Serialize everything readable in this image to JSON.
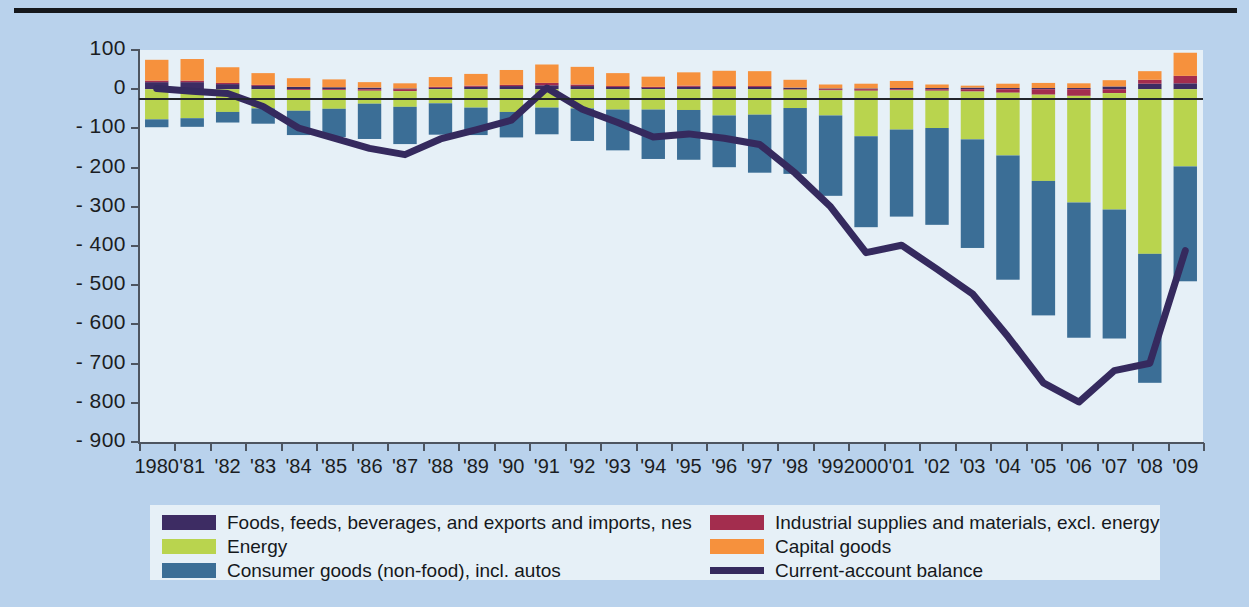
{
  "colors": {
    "background": "#b9d2ec",
    "plot_background": "#e6f0f7",
    "foods": "#3d2c63",
    "industrial": "#a32d4e",
    "energy": "#b9d44e",
    "capital": "#f6913d",
    "consumer": "#3b6e96",
    "balance_line": "#352a5e",
    "axis": "#4d5560",
    "text": "#15181c"
  },
  "axes": {
    "y_ticks": [
      "100",
      "0",
      "- 100",
      "- 200",
      "- 300",
      "- 400",
      "- 500",
      "- 600",
      "- 700",
      "- 800",
      "- 900"
    ],
    "y_tick_values": [
      100,
      0,
      -100,
      -200,
      -300,
      -400,
      -500,
      -600,
      -700,
      -800,
      -900
    ],
    "y_min": -900,
    "y_max": 100,
    "x_labels": [
      "1980",
      "'81",
      "'82",
      "'83",
      "'84",
      "'85",
      "'86",
      "'87",
      "'88",
      "'89",
      "'90",
      "'91",
      "'92",
      "'93",
      "'94",
      "'95",
      "'96",
      "'97",
      "'98",
      "'99",
      "2000",
      "'01",
      "'02",
      "'03",
      "'04",
      "'05",
      "'06",
      "'07",
      "'08",
      "'09"
    ]
  },
  "legend": {
    "left": [
      {
        "label": "Foods, feeds, beverages, and exports and imports, nes",
        "color": "#3d2c63",
        "type": "swatch",
        "icon": "legend-swatch-foods"
      },
      {
        "label": "Energy",
        "color": "#b9d44e",
        "type": "swatch",
        "icon": "legend-swatch-energy"
      },
      {
        "label": "Consumer goods (non-food), incl. autos",
        "color": "#3b6e96",
        "type": "swatch",
        "icon": "legend-swatch-consumer"
      }
    ],
    "right": [
      {
        "label": "Industrial supplies and materials, excl. energy",
        "color": "#a32d4e",
        "type": "swatch",
        "icon": "legend-swatch-industrial"
      },
      {
        "label": "Capital goods",
        "color": "#f6913d",
        "type": "swatch",
        "icon": "legend-swatch-capital"
      },
      {
        "label": "Current-account balance",
        "color": "#352a5e",
        "type": "line",
        "icon": "legend-line-balance"
      }
    ]
  },
  "chart_data": {
    "type": "bar",
    "title": "",
    "subtitle": "",
    "xlabel": "",
    "ylabel": "",
    "ylim": [
      -900,
      100
    ],
    "grid": false,
    "stacked": true,
    "legend_position": "bottom",
    "categories": [
      "1980",
      "1981",
      "1982",
      "1983",
      "1984",
      "1985",
      "1986",
      "1987",
      "1988",
      "1989",
      "1990",
      "1991",
      "1992",
      "1993",
      "1994",
      "1995",
      "1996",
      "1997",
      "1998",
      "1999",
      "2000",
      "2001",
      "2002",
      "2003",
      "2004",
      "2005",
      "2006",
      "2007",
      "2008",
      "2009"
    ],
    "series": [
      {
        "name": "Foods, feeds, beverages, and exports and imports, nes",
        "color": "#3d2c63",
        "values": [
          18,
          18,
          13,
          9,
          6,
          5,
          4,
          2,
          4,
          6,
          8,
          10,
          8,
          6,
          5,
          6,
          6,
          6,
          4,
          2,
          2,
          3,
          3,
          4,
          3,
          3,
          3,
          7,
          14,
          15
        ]
      },
      {
        "name": "Industrial supplies and materials, excl. energy",
        "color": "#a32d4e",
        "values": [
          4,
          4,
          3,
          2,
          -2,
          -2,
          -4,
          -5,
          2,
          3,
          3,
          6,
          4,
          2,
          1,
          3,
          2,
          2,
          -1,
          -3,
          -4,
          -3,
          -4,
          -6,
          -9,
          -14,
          -17,
          -10,
          10,
          19
        ]
      },
      {
        "name": "Energy",
        "color": "#b9d44e",
        "values": [
          -77,
          -74,
          -58,
          -49,
          -53,
          -48,
          -33,
          -40,
          -36,
          -47,
          -58,
          -47,
          -49,
          -52,
          -52,
          -53,
          -67,
          -65,
          -47,
          -64,
          -116,
          -100,
          -95,
          -122,
          -160,
          -220,
          -272,
          -297,
          -420,
          -197
        ]
      },
      {
        "name": "Capital goods",
        "color": "#f6913d",
        "values": [
          53,
          55,
          40,
          30,
          22,
          20,
          14,
          13,
          25,
          30,
          38,
          47,
          45,
          33,
          26,
          34,
          39,
          38,
          20,
          10,
          12,
          18,
          9,
          5,
          11,
          13,
          12,
          16,
          22,
          59
        ]
      },
      {
        "name": "Consumer goods (non-food), incl. autos",
        "color": "#3b6e96",
        "values": [
          -20,
          -22,
          -27,
          -39,
          -62,
          -72,
          -90,
          -95,
          -80,
          -70,
          -65,
          -68,
          -83,
          -104,
          -126,
          -127,
          -132,
          -148,
          -168,
          -205,
          -232,
          -222,
          -247,
          -277,
          -317,
          -343,
          -345,
          -329,
          -329,
          -293
        ]
      }
    ],
    "overlay_line": {
      "name": "Current-account balance",
      "color": "#352a5e",
      "type": "line",
      "values": [
        2,
        -5,
        -11,
        -44,
        -99,
        -125,
        -151,
        -167,
        -127,
        -104,
        -79,
        3,
        -51,
        -85,
        -122,
        -114,
        -125,
        -141,
        -214,
        -300,
        -417,
        -398,
        -459,
        -522,
        -631,
        -749,
        -798,
        -718,
        -699,
        -412
      ]
    }
  }
}
